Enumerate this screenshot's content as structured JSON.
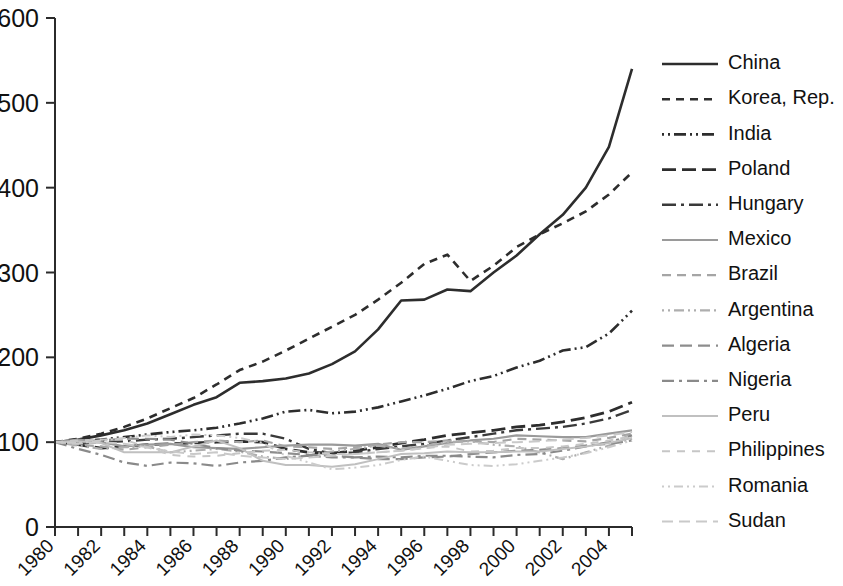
{
  "chart_data": {
    "type": "line",
    "title": "",
    "subtitle": "",
    "xlabel": "",
    "ylabel": "",
    "xlim": [
      1980,
      2005
    ],
    "ylim": [
      0,
      600
    ],
    "yticks": [
      0,
      100,
      200,
      300,
      400,
      500,
      600
    ],
    "xticks": [
      1980,
      1981,
      1982,
      1983,
      1984,
      1985,
      1986,
      1987,
      1988,
      1989,
      1990,
      1991,
      1992,
      1993,
      1994,
      1995,
      1996,
      1997,
      1998,
      1999,
      2000,
      2001,
      2002,
      2003,
      2004,
      2005
    ],
    "xtick_labels": [
      "1980",
      "",
      "1982",
      "",
      "1984",
      "",
      "1986",
      "",
      "1988",
      "",
      "1990",
      "",
      "1992",
      "",
      "1994",
      "",
      "1996",
      "",
      "1998",
      "",
      "2000",
      "",
      "2002",
      "",
      "2004",
      ""
    ],
    "grid": false,
    "legend_position": "right",
    "x": [
      1980,
      1981,
      1982,
      1983,
      1984,
      1985,
      1986,
      1987,
      1988,
      1989,
      1990,
      1991,
      1992,
      1993,
      1994,
      1995,
      1996,
      1997,
      1998,
      1999,
      2000,
      2001,
      2002,
      2003,
      2004,
      2005
    ],
    "series": [
      {
        "name": "China",
        "color": "#2d2d2d",
        "width": 2.6,
        "dash": "none",
        "legend_sample": "solid",
        "values": [
          100,
          103,
          108,
          114,
          122,
          133,
          144,
          153,
          170,
          172,
          175,
          181,
          192,
          207,
          233,
          267,
          268,
          280,
          278,
          300,
          320,
          345,
          368,
          400,
          448,
          540
        ]
      },
      {
        "name": "Korea, Rep.",
        "color": "#2d2d2d",
        "width": 2.6,
        "dash": "8,6",
        "legend_sample": "dashed",
        "values": [
          100,
          104,
          110,
          118,
          128,
          140,
          152,
          168,
          185,
          195,
          208,
          222,
          236,
          250,
          268,
          288,
          310,
          321,
          290,
          308,
          330,
          345,
          358,
          372,
          392,
          418
        ]
      },
      {
        "name": "India",
        "color": "#2d2d2d",
        "width": 2.6,
        "dash": "2,4,2,4,12,4",
        "legend_sample": "dash-dot-dot",
        "values": [
          100,
          101,
          103,
          106,
          109,
          112,
          114,
          117,
          122,
          128,
          136,
          138,
          134,
          136,
          141,
          148,
          155,
          163,
          172,
          178,
          188,
          196,
          208,
          212,
          228,
          255
        ]
      },
      {
        "name": "Poland",
        "color": "#2d2d2d",
        "width": 2.8,
        "dash": "14,6",
        "legend_sample": "long-dash",
        "values": [
          100,
          97,
          93,
          95,
          97,
          98,
          99,
          100,
          101,
          100,
          92,
          88,
          87,
          90,
          94,
          99,
          103,
          108,
          111,
          114,
          118,
          120,
          124,
          129,
          136,
          147
        ]
      },
      {
        "name": "Hungary",
        "color": "#3a3a3a",
        "width": 2.4,
        "dash": "14,5,3,5",
        "legend_sample": "dash-dot",
        "values": [
          100,
          99,
          100,
          101,
          103,
          104,
          106,
          108,
          110,
          110,
          104,
          92,
          87,
          88,
          92,
          95,
          98,
          102,
          106,
          110,
          114,
          116,
          118,
          122,
          128,
          138
        ]
      },
      {
        "name": "Mexico",
        "color": "#9a9a9a",
        "width": 2.2,
        "dash": "none",
        "legend_sample": "solid-light",
        "values": [
          100,
          103,
          100,
          95,
          97,
          98,
          94,
          93,
          92,
          94,
          96,
          97,
          97,
          96,
          98,
          91,
          95,
          99,
          102,
          104,
          108,
          107,
          106,
          106,
          110,
          114
        ]
      },
      {
        "name": "Brazil",
        "color": "#a5a5a5",
        "width": 2.2,
        "dash": "9,6",
        "legend_sample": "dashed-light",
        "values": [
          100,
          97,
          95,
          91,
          94,
          97,
          100,
          102,
          100,
          102,
          95,
          94,
          92,
          94,
          97,
          100,
          100,
          102,
          101,
          100,
          104,
          103,
          102,
          101,
          105,
          110
        ]
      },
      {
        "name": "Argentina",
        "color": "#aeaeae",
        "width": 2.2,
        "dash": "2,4,2,4,10,4",
        "legend_sample": "dash-dot-dot-light",
        "values": [
          100,
          96,
          92,
          94,
          95,
          88,
          90,
          92,
          89,
          83,
          80,
          85,
          89,
          92,
          96,
          92,
          96,
          100,
          101,
          97,
          95,
          88,
          80,
          88,
          96,
          104
        ]
      },
      {
        "name": "Algeria",
        "color": "#8d8d8d",
        "width": 2.2,
        "dash": "12,6",
        "legend_sample": "long-dash-light",
        "values": [
          100,
          101,
          102,
          104,
          104,
          103,
          98,
          93,
          90,
          89,
          87,
          85,
          84,
          82,
          80,
          80,
          82,
          83,
          86,
          88,
          90,
          91,
          93,
          96,
          98,
          102
        ]
      },
      {
        "name": "Nigeria",
        "color": "#8a8a8a",
        "width": 2.2,
        "dash": "12,5,3,5",
        "legend_sample": "dash-dot-light",
        "values": [
          100,
          92,
          85,
          76,
          72,
          76,
          75,
          72,
          76,
          78,
          82,
          84,
          82,
          82,
          83,
          82,
          84,
          84,
          83,
          82,
          85,
          86,
          90,
          95,
          100,
          108
        ]
      },
      {
        "name": "Peru",
        "color": "#c0c0c0",
        "width": 2.0,
        "dash": "none",
        "legend_sample": "solid-vlight",
        "values": [
          100,
          101,
          99,
          88,
          88,
          88,
          95,
          102,
          93,
          78,
          73,
          73,
          71,
          74,
          80,
          86,
          87,
          89,
          88,
          88,
          89,
          89,
          92,
          95,
          99,
          105
        ]
      },
      {
        "name": "Philippines",
        "color": "#c6c6c6",
        "width": 2.0,
        "dash": "8,7",
        "legend_sample": "dashed-vlight",
        "values": [
          100,
          102,
          103,
          103,
          94,
          85,
          83,
          84,
          87,
          90,
          91,
          88,
          86,
          86,
          88,
          90,
          93,
          95,
          89,
          90,
          93,
          93,
          95,
          98,
          102,
          107
        ]
      },
      {
        "name": "Romania",
        "color": "#cbcbcb",
        "width": 2.0,
        "dash": "2,4,2,4,9,4",
        "legend_sample": "dash-dot-dot-vlight",
        "values": [
          100,
          99,
          102,
          105,
          108,
          106,
          109,
          108,
          105,
          99,
          84,
          76,
          68,
          70,
          73,
          79,
          83,
          78,
          73,
          72,
          74,
          78,
          82,
          87,
          94,
          102
        ]
      },
      {
        "name": "Sudan",
        "color": "#c9c9c9",
        "width": 2.0,
        "dash": "11,6",
        "legend_sample": "long-dash-vlight",
        "values": [
          100,
          98,
          100,
          98,
          94,
          89,
          86,
          88,
          84,
          82,
          80,
          82,
          84,
          86,
          88,
          90,
          93,
          97,
          98,
          99,
          100,
          101,
          103,
          105,
          108,
          112
        ]
      }
    ]
  },
  "legend": {
    "entries": [
      {
        "label": "China"
      },
      {
        "label": "Korea, Rep."
      },
      {
        "label": "India"
      },
      {
        "label": "Poland"
      },
      {
        "label": "Hungary"
      },
      {
        "label": "Mexico"
      },
      {
        "label": "Brazil"
      },
      {
        "label": "Argentina"
      },
      {
        "label": "Algeria"
      },
      {
        "label": "Nigeria"
      },
      {
        "label": "Peru"
      },
      {
        "label": "Philippines"
      },
      {
        "label": "Romania"
      },
      {
        "label": "Sudan"
      }
    ]
  }
}
